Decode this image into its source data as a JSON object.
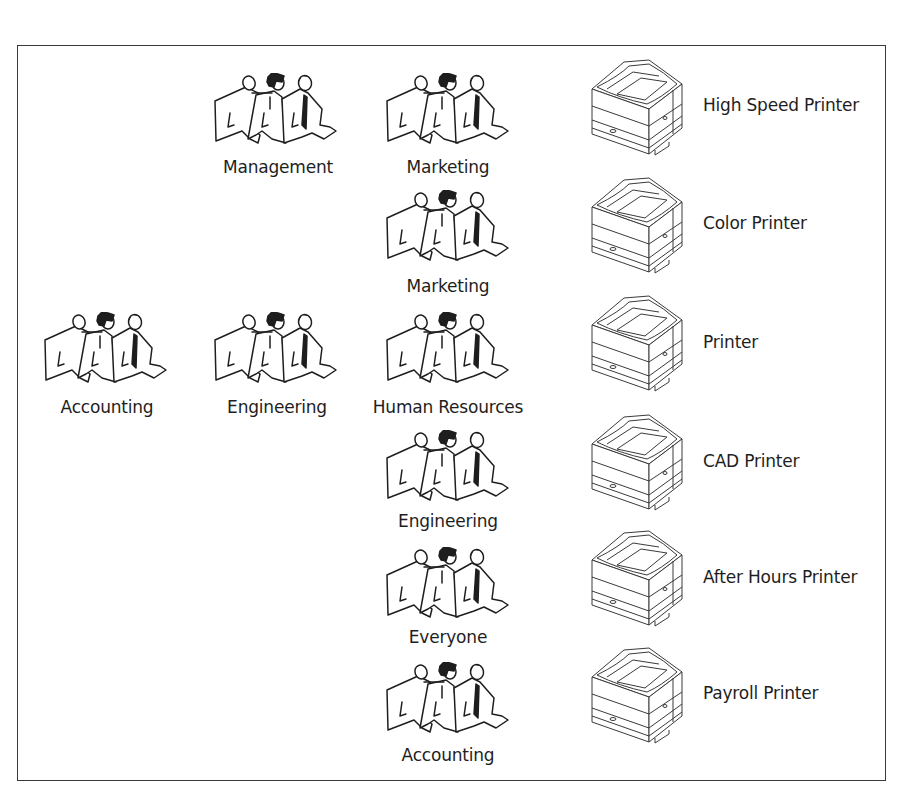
{
  "diagram": {
    "colors": {
      "line": "#1e1e1e",
      "frame": "#3a3a3a",
      "background": "#ffffff"
    },
    "groups": [
      {
        "id": "g1",
        "label": "Management",
        "icon": "people-group-icon"
      },
      {
        "id": "g2",
        "label": "Marketing",
        "icon": "people-group-icon"
      },
      {
        "id": "g3",
        "label": "Marketing",
        "icon": "people-group-icon"
      },
      {
        "id": "g4",
        "label": "Accounting",
        "icon": "people-group-icon"
      },
      {
        "id": "g5",
        "label": "Engineering",
        "icon": "people-group-icon"
      },
      {
        "id": "g6",
        "label": "Human Resources",
        "icon": "people-group-icon"
      },
      {
        "id": "g7",
        "label": "Engineering",
        "icon": "people-group-icon"
      },
      {
        "id": "g8",
        "label": "Everyone",
        "icon": "people-group-icon"
      },
      {
        "id": "g9",
        "label": "Accounting",
        "icon": "people-group-icon"
      }
    ],
    "printers": [
      {
        "label": "High Speed Printer",
        "icon": "laser-printer-icon"
      },
      {
        "label": "Color Printer",
        "icon": "laser-printer-icon"
      },
      {
        "label": "Printer",
        "icon": "laser-printer-icon"
      },
      {
        "label": "CAD Printer",
        "icon": "laser-printer-icon"
      },
      {
        "label": "After Hours Printer",
        "icon": "laser-printer-icon"
      },
      {
        "label": "Payroll Printer",
        "icon": "laser-printer-icon"
      }
    ]
  }
}
